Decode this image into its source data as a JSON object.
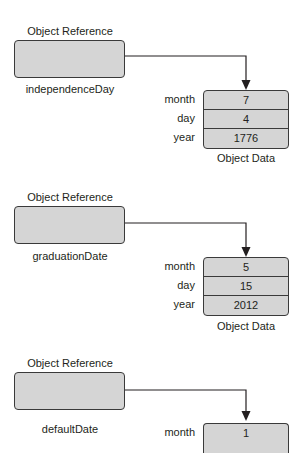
{
  "diagram": {
    "colors": {
      "box_fill": "#d5d5d5",
      "stroke": "#3a3a3a",
      "text": "#231f20"
    },
    "groups": [
      {
        "reference_title": "Object Reference",
        "reference_name": "independenceDay",
        "data_caption": "Object Data",
        "fields": [
          {
            "label": "month",
            "value": "7"
          },
          {
            "label": "day",
            "value": "4"
          },
          {
            "label": "year",
            "value": "1776"
          }
        ]
      },
      {
        "reference_title": "Object Reference",
        "reference_name": "graduationDate",
        "data_caption": "Object Data",
        "fields": [
          {
            "label": "month",
            "value": "5"
          },
          {
            "label": "day",
            "value": "15"
          },
          {
            "label": "year",
            "value": "2012"
          }
        ]
      },
      {
        "reference_title": "Object Reference",
        "reference_name": "defaultDate",
        "fields": [
          {
            "label": "month",
            "value": "1"
          }
        ]
      }
    ]
  }
}
